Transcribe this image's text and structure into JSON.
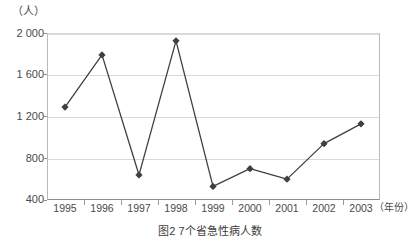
{
  "figure": {
    "caption": "图2  7个省急性病人数",
    "y_unit_label": "（人）",
    "x_unit_label": "（年份）"
  },
  "chart_data": {
    "type": "line",
    "title": "图2  7个省急性病人数",
    "xlabel": "（年份）",
    "ylabel": "（人）",
    "categories": [
      "1995",
      "1996",
      "1997",
      "1998",
      "1999",
      "2000",
      "2001",
      "2002",
      "2003"
    ],
    "values": [
      1290,
      1790,
      640,
      1925,
      530,
      700,
      600,
      940,
      1130
    ],
    "ylim": [
      400,
      2000
    ],
    "ytick_labels": [
      "400",
      "800",
      "1 200",
      "1 600",
      "2 000"
    ],
    "ytick_values": [
      400,
      800,
      1200,
      1600,
      2000
    ],
    "grid": true,
    "legend": "none",
    "series_color": "#404040",
    "grid_color": "#d9d9d9",
    "axis_color": "#8e8e8e",
    "marker": "diamond"
  }
}
